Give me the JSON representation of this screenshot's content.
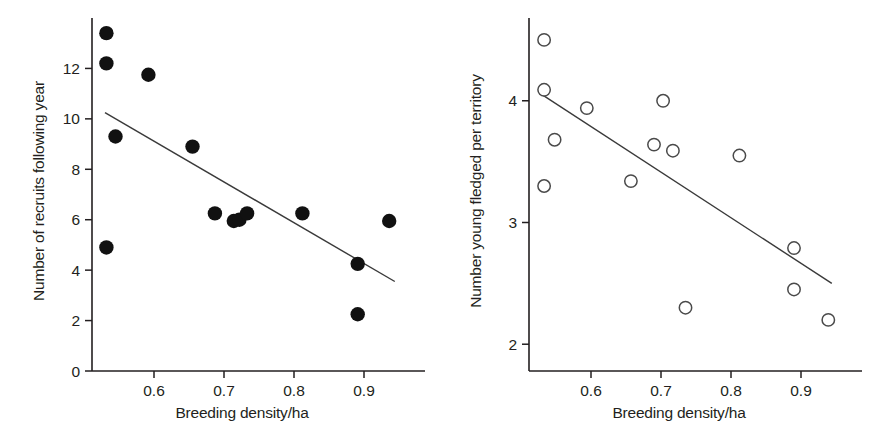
{
  "figure": {
    "background": "#ffffff",
    "ink": "#231f20",
    "width": 874,
    "height": 445
  },
  "chart_data": [
    {
      "id": "left",
      "type": "scatter",
      "title": "",
      "xlabel": "Breeding density/ha",
      "ylabel": "Number of recruits following year",
      "marker": "filled-circle",
      "marker_color": "#111111",
      "xlim": [
        0.515,
        0.955
      ],
      "ylim": [
        0,
        14.0
      ],
      "xticks": [
        0.6,
        0.7,
        0.8,
        0.9
      ],
      "xticklabels": [
        "0.6",
        "0.7",
        "0.8",
        "0.9"
      ],
      "yticks": [
        0,
        2,
        4,
        6,
        8,
        10,
        12
      ],
      "yticklabels": [
        "0",
        "2",
        "4",
        "6",
        "8",
        "10",
        "12"
      ],
      "grid": false,
      "legend": null,
      "points": [
        {
          "x": 0.532,
          "y": 13.4
        },
        {
          "x": 0.532,
          "y": 12.2
        },
        {
          "x": 0.532,
          "y": 4.9
        },
        {
          "x": 0.545,
          "y": 9.3
        },
        {
          "x": 0.592,
          "y": 11.75
        },
        {
          "x": 0.655,
          "y": 8.9
        },
        {
          "x": 0.687,
          "y": 6.25
        },
        {
          "x": 0.714,
          "y": 5.95
        },
        {
          "x": 0.722,
          "y": 6.0
        },
        {
          "x": 0.733,
          "y": 6.25
        },
        {
          "x": 0.812,
          "y": 6.25
        },
        {
          "x": 0.891,
          "y": 4.25
        },
        {
          "x": 0.891,
          "y": 2.25
        },
        {
          "x": 0.936,
          "y": 5.95
        }
      ],
      "fit_line": {
        "x0": 0.53,
        "y0": 10.25,
        "x1": 0.944,
        "y1": 3.55
      }
    },
    {
      "id": "right",
      "type": "scatter",
      "title": "",
      "xlabel": "Breeding density/ha",
      "ylabel": "Number young fledged per territory",
      "marker": "open-circle",
      "marker_color": "#4a4a4a",
      "xlim": [
        0.515,
        0.955
      ],
      "ylim": [
        1.78,
        4.68
      ],
      "xticks": [
        0.6,
        0.7,
        0.8,
        0.9
      ],
      "xticklabels": [
        "0.6",
        "0.7",
        "0.8",
        "0.9"
      ],
      "yticks": [
        2,
        3,
        4
      ],
      "yticklabels": [
        "2",
        "3",
        "4"
      ],
      "grid": false,
      "legend": null,
      "points": [
        {
          "x": 0.533,
          "y": 4.5
        },
        {
          "x": 0.533,
          "y": 4.09
        },
        {
          "x": 0.533,
          "y": 3.3
        },
        {
          "x": 0.548,
          "y": 3.68
        },
        {
          "x": 0.594,
          "y": 3.94
        },
        {
          "x": 0.657,
          "y": 3.34
        },
        {
          "x": 0.69,
          "y": 3.64
        },
        {
          "x": 0.703,
          "y": 4.0
        },
        {
          "x": 0.717,
          "y": 3.59
        },
        {
          "x": 0.735,
          "y": 2.3
        },
        {
          "x": 0.812,
          "y": 3.55
        },
        {
          "x": 0.89,
          "y": 2.79
        },
        {
          "x": 0.89,
          "y": 2.45
        },
        {
          "x": 0.939,
          "y": 2.2
        }
      ],
      "fit_line": {
        "x0": 0.53,
        "y0": 4.05,
        "x1": 0.944,
        "y1": 2.5
      }
    }
  ]
}
